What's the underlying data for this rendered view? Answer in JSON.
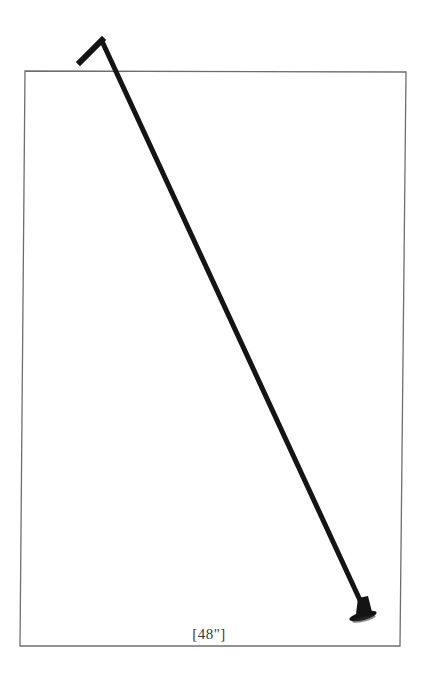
{
  "figure": {
    "caption": "[48\"]",
    "colors": {
      "background": "#ffffff",
      "frame_border": "#6e6e6e",
      "rod": "#141414",
      "caption_text": "#3a3a3a"
    },
    "frame": {
      "corners": {
        "top_left": [
          25,
          71
        ],
        "top_right": [
          406,
          72
        ],
        "bottom_right": [
          400,
          646
        ],
        "bottom_left": [
          20,
          646
        ]
      }
    },
    "rod": {
      "hook_end": [
        80,
        62
      ],
      "apex": [
        102,
        39
      ],
      "foot_end": [
        365,
        611
      ],
      "thickness": 5
    },
    "foot_plate": {
      "center": [
        363,
        616
      ],
      "rx": 14,
      "ry": 4,
      "rotation": -14
    }
  }
}
